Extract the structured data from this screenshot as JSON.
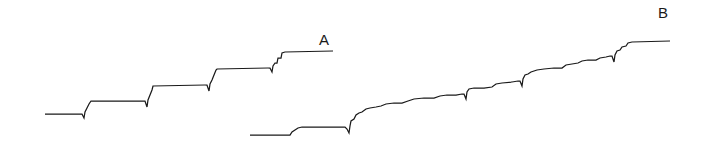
{
  "figure": {
    "width": 711,
    "height": 158,
    "background_color": "#ffffff",
    "line_color": "#1a1a1a",
    "line_width": 1.25
  },
  "labels": {
    "trace_a": "A",
    "trace_b": "B"
  },
  "chart_data": {
    "type": "line",
    "title": "",
    "subtitle": "",
    "xlabel": "",
    "ylabel": "",
    "grid": false,
    "legend_position": "inline-right-of-trace",
    "axis_visible": false,
    "xlim": [
      0,
      711
    ],
    "ylim": [
      158,
      0
    ],
    "note": "Two stepwise (staircase) single-molecule traces. Y axis is inverted in pixel space: smaller y = higher signal. Each riser carries a small downward overshoot tick characteristic of the recording.",
    "series": [
      {
        "name": "A",
        "label": "A",
        "label_position": {
          "x": 319,
          "y": 32
        },
        "step_count": 5,
        "plateaus": [
          {
            "index": 0,
            "x_start": 45,
            "x_end": 83,
            "y": 114
          },
          {
            "index": 1,
            "x_start": 90,
            "x_end": 143,
            "y": 101
          },
          {
            "index": 2,
            "x_start": 152,
            "x_end": 205,
            "y": 85
          },
          {
            "index": 3,
            "x_start": 216,
            "x_end": 270,
            "y": 69
          },
          {
            "index": 4,
            "x_start": 283,
            "x_end": 333,
            "y": 52
          }
        ],
        "points": [
          [
            45,
            114
          ],
          [
            82,
            114
          ],
          [
            84,
            118
          ],
          [
            85,
            112
          ],
          [
            87,
            108
          ],
          [
            89,
            104
          ],
          [
            91,
            101
          ],
          [
            143,
            101
          ],
          [
            145,
            101
          ],
          [
            147,
            107
          ],
          [
            148,
            100
          ],
          [
            150,
            95
          ],
          [
            152,
            90
          ],
          [
            153,
            86
          ],
          [
            205,
            85
          ],
          [
            207,
            85
          ],
          [
            209,
            91
          ],
          [
            210,
            84
          ],
          [
            212,
            80
          ],
          [
            214,
            75
          ],
          [
            216,
            70
          ],
          [
            217,
            69
          ],
          [
            268,
            68
          ],
          [
            270,
            68
          ],
          [
            272,
            72
          ],
          [
            273,
            66
          ],
          [
            275,
            63
          ],
          [
            277,
            63
          ],
          [
            278,
            58
          ],
          [
            281,
            58
          ],
          [
            282,
            53
          ],
          [
            285,
            52
          ],
          [
            333,
            51
          ]
        ]
      },
      {
        "name": "B",
        "label": "B",
        "label_position": {
          "x": 658,
          "y": 5
        },
        "step_count": 12,
        "plateaus": [
          {
            "index": 0,
            "x_start": 250,
            "x_end": 290,
            "y": 135
          },
          {
            "index": 1,
            "x_start": 303,
            "x_end": 348,
            "y": 127
          },
          {
            "index": 2,
            "x_start": 358,
            "x_end": 378,
            "y": 110
          },
          {
            "index": 3,
            "x_start": 385,
            "x_end": 410,
            "y": 104
          },
          {
            "index": 4,
            "x_start": 415,
            "x_end": 440,
            "y": 99
          },
          {
            "index": 5,
            "x_start": 448,
            "x_end": 465,
            "y": 96
          },
          {
            "index": 6,
            "x_start": 470,
            "x_end": 494,
            "y": 89
          },
          {
            "index": 7,
            "x_start": 500,
            "x_end": 518,
            "y": 85
          },
          {
            "index": 8,
            "x_start": 524,
            "x_end": 540,
            "y": 78
          },
          {
            "index": 9,
            "x_start": 547,
            "x_end": 570,
            "y": 70
          },
          {
            "index": 10,
            "x_start": 578,
            "x_end": 600,
            "y": 65
          },
          {
            "index": 11,
            "x_start": 608,
            "x_end": 670,
            "y": 42
          }
        ],
        "points": [
          [
            250,
            135
          ],
          [
            288,
            135
          ],
          [
            290,
            135
          ],
          [
            292,
            132
          ],
          [
            295,
            130
          ],
          [
            298,
            128
          ],
          [
            302,
            127
          ],
          [
            340,
            127
          ],
          [
            345,
            127
          ],
          [
            347,
            129
          ],
          [
            349,
            133
          ],
          [
            350,
            126
          ],
          [
            351,
            121
          ],
          [
            354,
            119
          ],
          [
            356,
            115
          ],
          [
            359,
            113
          ],
          [
            362,
            112
          ],
          [
            366,
            109
          ],
          [
            370,
            108
          ],
          [
            376,
            107
          ],
          [
            381,
            106
          ],
          [
            386,
            104
          ],
          [
            394,
            103
          ],
          [
            402,
            103
          ],
          [
            408,
            101
          ],
          [
            414,
            99
          ],
          [
            424,
            98
          ],
          [
            434,
            98
          ],
          [
            440,
            96
          ],
          [
            447,
            95
          ],
          [
            456,
            95
          ],
          [
            462,
            94
          ],
          [
            464,
            94
          ],
          [
            466,
            99
          ],
          [
            467,
            92
          ],
          [
            469,
            89
          ],
          [
            474,
            88
          ],
          [
            484,
            88
          ],
          [
            492,
            87
          ],
          [
            496,
            84
          ],
          [
            502,
            83
          ],
          [
            512,
            82
          ],
          [
            518,
            81
          ],
          [
            520,
            81
          ],
          [
            522,
            86
          ],
          [
            523,
            79
          ],
          [
            525,
            75
          ],
          [
            528,
            74
          ],
          [
            531,
            72
          ],
          [
            534,
            71
          ],
          [
            537,
            70
          ],
          [
            544,
            69
          ],
          [
            554,
            68
          ],
          [
            562,
            68
          ],
          [
            566,
            65
          ],
          [
            572,
            64
          ],
          [
            578,
            63
          ],
          [
            582,
            61
          ],
          [
            588,
            60
          ],
          [
            596,
            60
          ],
          [
            600,
            58
          ],
          [
            606,
            57
          ],
          [
            610,
            56
          ],
          [
            612,
            56
          ],
          [
            614,
            62
          ],
          [
            615,
            55
          ],
          [
            617,
            51
          ],
          [
            620,
            50
          ],
          [
            622,
            47
          ],
          [
            626,
            46
          ],
          [
            628,
            43
          ],
          [
            632,
            42
          ],
          [
            670,
            41
          ]
        ]
      }
    ]
  }
}
